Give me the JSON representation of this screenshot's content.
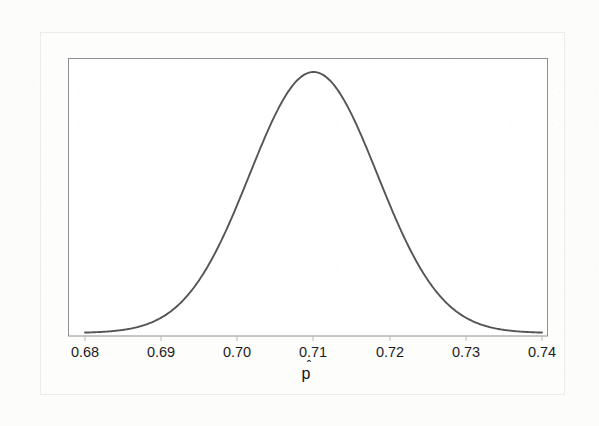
{
  "figure": {
    "background_color": "#fcfcfb",
    "frame_color": "#8c8c8c",
    "curve_color": "#555555",
    "tick_text_color": "#1c1c1c"
  },
  "chart_data": {
    "type": "line",
    "title": "",
    "subtitle": "",
    "xlabel": "p̂",
    "xlabel_base": "p",
    "xlabel_accent": "ˆ",
    "ylabel": "",
    "grid": false,
    "legend": null,
    "annotations": [],
    "xlim": [
      0.68,
      0.74
    ],
    "ylim": [
      0,
      1
    ],
    "xtick_labels": [
      "0.68",
      "0.69",
      "0.70",
      "0.71",
      "0.72",
      "0.73",
      "0.74"
    ],
    "xtick_values": [
      0.68,
      0.69,
      0.7,
      0.71,
      0.72,
      0.73,
      0.74
    ],
    "ytick_labels": [],
    "ytick_values": [],
    "distribution": {
      "name": "normal",
      "mean": 0.71,
      "std_dev": 0.0084,
      "peak_x": 0.71,
      "peak_y": 1.0
    },
    "series": [
      {
        "name": "Sampling distribution of p-hat",
        "x": [
          0.68,
          0.681,
          0.682,
          0.683,
          0.684,
          0.685,
          0.686,
          0.687,
          0.688,
          0.689,
          0.69,
          0.691,
          0.692,
          0.693,
          0.694,
          0.695,
          0.696,
          0.697,
          0.698,
          0.699,
          0.7,
          0.701,
          0.702,
          0.703,
          0.704,
          0.705,
          0.706,
          0.707,
          0.708,
          0.709,
          0.71,
          0.711,
          0.712,
          0.713,
          0.714,
          0.715,
          0.716,
          0.717,
          0.718,
          0.719,
          0.72,
          0.721,
          0.722,
          0.723,
          0.724,
          0.725,
          0.726,
          0.727,
          0.728,
          0.729,
          0.73,
          0.731,
          0.732,
          0.733,
          0.734,
          0.735,
          0.736,
          0.737,
          0.738,
          0.739,
          0.74
        ],
        "y": [
          0.0001,
          0.0002,
          0.0004,
          0.0007,
          0.0013,
          0.0023,
          0.0039,
          0.0065,
          0.0106,
          0.0168,
          0.026,
          0.0392,
          0.0577,
          0.0828,
          0.1159,
          0.158,
          0.2099,
          0.2717,
          0.3425,
          0.4206,
          0.5033,
          0.5871,
          0.668,
          0.7418,
          0.8046,
          0.8534,
          0.8861,
          0.9017,
          0.9017,
          0.8861,
          1.0,
          0.8861,
          0.9017,
          0.9017,
          0.8861,
          0.8534,
          0.8046,
          0.7418,
          0.668,
          0.5871,
          0.5033,
          0.4206,
          0.3425,
          0.2717,
          0.2099,
          0.158,
          0.1159,
          0.0828,
          0.0577,
          0.0392,
          0.026,
          0.0168,
          0.0106,
          0.0065,
          0.0039,
          0.0023,
          0.0013,
          0.0007,
          0.0004,
          0.0002,
          0.0001
        ]
      }
    ],
    "plot_frame": {
      "left_px": 68,
      "top_px": 58,
      "right_px": 548,
      "bottom_px": 336,
      "baseline_px": 333,
      "peak_px_x": 306,
      "peak_px_y": 72
    }
  }
}
